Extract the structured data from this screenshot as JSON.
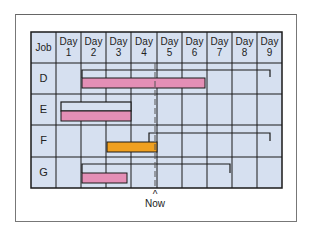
{
  "diagram": {
    "type": "gantt",
    "header": {
      "job_label": "Job",
      "days": [
        {
          "l1": "Day",
          "l2": "1"
        },
        {
          "l1": "Day",
          "l2": "2"
        },
        {
          "l1": "Day",
          "l2": "3"
        },
        {
          "l1": "Day",
          "l2": "4"
        },
        {
          "l1": "Day",
          "l2": "5"
        },
        {
          "l1": "Day",
          "l2": "6"
        },
        {
          "l1": "Day",
          "l2": "7"
        },
        {
          "l1": "Day",
          "l2": "8"
        },
        {
          "l1": "Day",
          "l2": "9"
        }
      ]
    },
    "jobs": [
      {
        "name": "D",
        "scheduled": {
          "start_day": 2,
          "end_day": 9
        },
        "actual": {
          "start_day": 2,
          "end_day": 6
        }
      },
      {
        "name": "E",
        "scheduled": {
          "start_day": 1,
          "end_day": 3
        },
        "actual": {
          "start_day": 1,
          "end_day": 3
        }
      },
      {
        "name": "F",
        "scheduled": {
          "start_day": 4,
          "end_day": 9
        },
        "actual": {
          "start_day": 3,
          "end_day": 4
        }
      },
      {
        "name": "G",
        "scheduled": {
          "start_day": 2,
          "end_day": 7
        },
        "actual": {
          "start_day": 2,
          "end_day": 3
        }
      }
    ],
    "now_marker": {
      "label": "Now",
      "caret": "^",
      "day_position": 4
    },
    "colors": {
      "grid_fill": "#d6e0f0",
      "pink_bar": "#e48fb6",
      "orange_bar": "#f0a020",
      "line": "#1a1a1a"
    }
  }
}
